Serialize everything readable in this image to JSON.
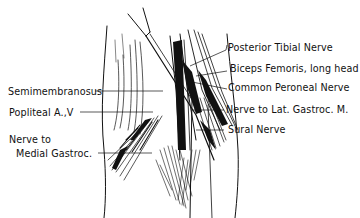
{
  "diagram": {
    "type": "anatomical-illustration",
    "colors": {
      "ink": "#111111",
      "background": "#ffffff"
    },
    "labels_right": [
      {
        "id": "posterior-tibial-nerve",
        "text": "Posterior Tibial Nerve"
      },
      {
        "id": "biceps-femoris",
        "text": "Biceps Femoris, long head"
      },
      {
        "id": "common-peroneal-nerve",
        "text": "Common Peroneal Nerve"
      },
      {
        "id": "nerve-lat-gastroc",
        "text": "Nerve to Lat. Gastroc. M."
      },
      {
        "id": "sural-nerve",
        "text": "Sural Nerve"
      }
    ],
    "labels_left": [
      {
        "id": "semimembranosus",
        "text": "Semimembranosus"
      },
      {
        "id": "popliteal-av",
        "text": "Popliteal A.,V"
      },
      {
        "id": "nerve-medial-gastroc",
        "line1": "Nerve to",
        "line2": "Medial Gastroc."
      }
    ]
  }
}
